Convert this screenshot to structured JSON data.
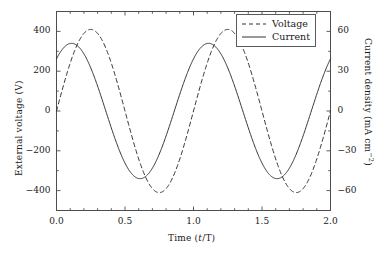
{
  "chart_data": {
    "type": "line",
    "title": "",
    "xlabel": "Time (t/T)",
    "ylabel": "External voltage (V)",
    "y2label": "Current density (mA cm−2)",
    "xlim": [
      0.0,
      2.0
    ],
    "ylim": [
      -500,
      500
    ],
    "y2lim": [
      -75,
      75
    ],
    "grid": false,
    "legend_position": "top-right",
    "xticks": [
      0.0,
      0.5,
      1.0,
      1.5,
      2.0
    ],
    "xticklabels": [
      "0.0",
      "0.5",
      "1.0",
      "1.5",
      "2.0"
    ],
    "yticks": [
      -400,
      -200,
      0,
      200,
      400
    ],
    "yticklabels": [
      "−400",
      "−200",
      "0",
      "200",
      "400"
    ],
    "y2ticks": [
      -60,
      -30,
      0,
      30,
      60
    ],
    "y2ticklabels": [
      "−60",
      "−30",
      "0",
      "30",
      "60"
    ],
    "series": [
      {
        "name": "Voltage",
        "style": "dashed",
        "axis": "left",
        "units": "V",
        "amplitude": 410,
        "period": 1.0,
        "peak_time": 0.25,
        "value_at_t0": 25,
        "x": [
          0.0,
          0.05,
          0.1,
          0.15,
          0.2,
          0.25,
          0.3,
          0.35,
          0.4,
          0.45,
          0.5,
          0.55,
          0.6,
          0.65,
          0.7,
          0.75,
          0.8,
          0.85,
          0.9,
          0.95,
          1.0,
          1.05,
          1.1,
          1.15,
          1.2,
          1.25,
          1.3,
          1.35,
          1.4,
          1.45,
          1.5,
          1.55,
          1.6,
          1.65,
          1.7,
          1.75,
          1.8,
          1.85,
          1.9,
          1.95,
          2.0
        ],
        "values": [
          25,
          147,
          254,
          339,
          392,
          410,
          392,
          339,
          254,
          147,
          25,
          -102,
          -222,
          -322,
          -390,
          -410,
          -390,
          -322,
          -222,
          -102,
          25,
          147,
          254,
          339,
          392,
          410,
          392,
          339,
          254,
          147,
          25,
          -102,
          -222,
          -322,
          -390,
          -410,
          -390,
          -322,
          -222,
          -102,
          25
        ]
      },
      {
        "name": "Current",
        "style": "solid",
        "axis": "right",
        "units": "mA cm−2",
        "amplitude_left_scale": 345,
        "amplitude": 51,
        "period": 1.0,
        "peak_time": 0.11,
        "value_at_t0": 310,
        "x": [
          0.0,
          0.05,
          0.1,
          0.15,
          0.2,
          0.25,
          0.3,
          0.35,
          0.4,
          0.45,
          0.5,
          0.55,
          0.6,
          0.65,
          0.7,
          0.75,
          0.8,
          0.85,
          0.9,
          0.95,
          1.0,
          1.05,
          1.1,
          1.15,
          1.2,
          1.25,
          1.3,
          1.35,
          1.4,
          1.45,
          1.5,
          1.55,
          1.6,
          1.65,
          1.7,
          1.75,
          1.8,
          1.85,
          1.9,
          1.95,
          2.0
        ],
        "values": [
          310,
          343,
          345,
          318,
          263,
          186,
          94,
          -6,
          -104,
          -195,
          -268,
          -319,
          -344,
          -341,
          -310,
          -253,
          -175,
          -81,
          19,
          117,
          206,
          278,
          328,
          345,
          332,
          288,
          218,
          128,
          28,
          -73,
          -166,
          -245,
          -303,
          -337,
          -344,
          -324,
          -276,
          -206,
          -119,
          -21,
          310
        ]
      }
    ]
  },
  "legend": {
    "items": [
      {
        "label": "Voltage",
        "style": "dashed"
      },
      {
        "label": "Current",
        "style": "solid"
      }
    ]
  },
  "axes": {
    "x_label_text": "Time (",
    "x_label_italic": "t",
    "x_label_tail": "/T)",
    "y_left_label": "External voltage (V)",
    "y_right_label_main": "Current density (mA cm",
    "y_right_label_sup": "−2",
    "y_right_label_tail": ")"
  },
  "colors": {
    "line": "#333333",
    "frame": "#4d4d4d",
    "text": "#1a1a1a",
    "background": "#ffffff"
  }
}
